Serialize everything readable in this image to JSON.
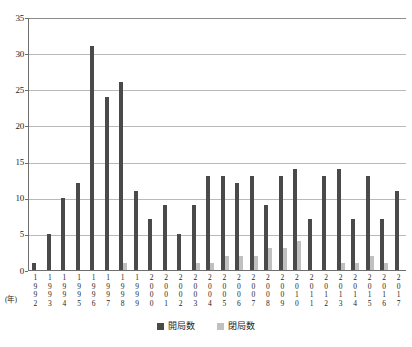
{
  "chart_data": {
    "type": "bar",
    "title": "",
    "xlabel": "(年)",
    "ylabel": "",
    "ylim": [
      0,
      35
    ],
    "ytick_step": 5,
    "yticks": [
      35,
      30,
      25,
      20,
      15,
      10,
      5,
      0
    ],
    "grid": true,
    "legend_position": "bottom-center",
    "categories": [
      "1992",
      "1993",
      "1994",
      "1995",
      "1996",
      "1997",
      "1998",
      "1999",
      "2000",
      "2001",
      "2002",
      "2003",
      "2004",
      "2005",
      "2006",
      "2007",
      "2008",
      "2009",
      "2010",
      "2011",
      "2012",
      "2013",
      "2014",
      "2015",
      "2016",
      "2017"
    ],
    "series": [
      {
        "name": "開局数",
        "color": "#4a4a4a",
        "values": [
          1,
          5,
          10,
          12,
          31,
          24,
          26,
          11,
          7,
          9,
          5,
          9,
          13,
          13,
          12,
          13,
          9,
          13,
          14,
          7,
          13,
          14,
          7,
          13,
          7,
          11
        ]
      },
      {
        "name": "閉局数",
        "color": "#c0c0c0",
        "values": [
          0,
          0,
          0,
          0,
          0,
          0,
          1,
          0,
          0,
          0,
          0,
          1,
          1,
          2,
          2,
          2,
          3,
          3,
          4,
          0,
          0,
          1,
          1,
          2,
          1,
          0
        ]
      }
    ]
  },
  "axis": {
    "year_unit_label": "(年)"
  }
}
